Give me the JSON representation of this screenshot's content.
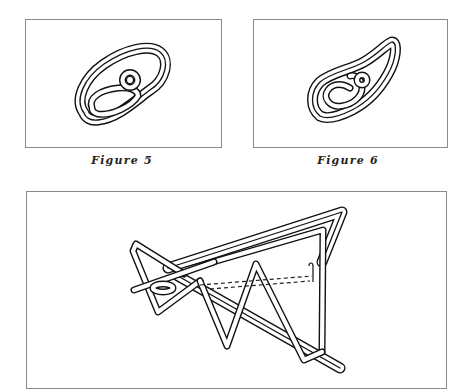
{
  "page": {
    "figures": [
      {
        "id": "figure-5",
        "caption": "Figure 5",
        "description": "coiled wire puzzle loop with small ring"
      },
      {
        "id": "figure-6",
        "caption": "Figure 6",
        "description": "paisley-shaped coiled wire puzzle"
      },
      {
        "id": "figure-7",
        "caption": "",
        "description": "triangular zigzag wire puzzle"
      }
    ],
    "colors": {
      "line": "#111111",
      "frame": "#8a8a8a",
      "background": "#ffffff"
    }
  }
}
